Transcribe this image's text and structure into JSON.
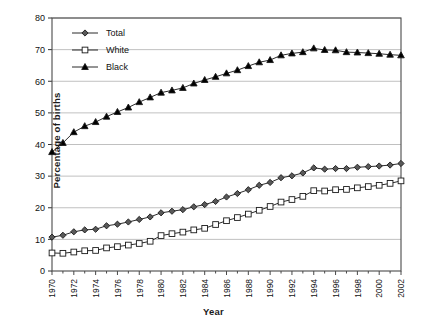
{
  "chart_data": {
    "type": "line",
    "title": "",
    "xlabel": "Year",
    "ylabel": "Percentage of births",
    "xlim": [
      1970,
      2002
    ],
    "ylim": [
      0,
      80
    ],
    "ytick_step": 10,
    "yticks": [
      "0",
      "10",
      "20",
      "30",
      "40",
      "50",
      "60",
      "70",
      "80"
    ],
    "xticks": [
      "1970",
      "1972",
      "1974",
      "1976",
      "1978",
      "1980",
      "1982",
      "1984",
      "1986",
      "1988",
      "1990",
      "1992",
      "1994",
      "1996",
      "1998",
      "2000",
      "2002"
    ],
    "grid": "horizontal",
    "legend_position": "upper-left-inside",
    "x": [
      1970,
      1971,
      1972,
      1973,
      1974,
      1975,
      1976,
      1977,
      1978,
      1979,
      1980,
      1981,
      1982,
      1983,
      1984,
      1985,
      1986,
      1987,
      1988,
      1989,
      1990,
      1991,
      1992,
      1993,
      1994,
      1995,
      1996,
      1997,
      1998,
      1999,
      2000,
      2001,
      2002
    ],
    "series": [
      {
        "name": "Total",
        "marker": "diamond",
        "color": "#595959",
        "values": [
          10.7,
          11.3,
          12.4,
          13.0,
          13.2,
          14.3,
          14.8,
          15.5,
          16.3,
          17.1,
          18.4,
          18.9,
          19.4,
          20.3,
          21.0,
          22.0,
          23.4,
          24.5,
          25.7,
          27.1,
          28.0,
          29.5,
          30.1,
          31.0,
          32.6,
          32.2,
          32.4,
          32.4,
          32.8,
          33.0,
          33.2,
          33.5,
          34.0
        ]
      },
      {
        "name": "White",
        "marker": "square",
        "color": "#ffffff",
        "values": [
          5.7,
          5.6,
          6.0,
          6.4,
          6.5,
          7.3,
          7.7,
          8.2,
          8.7,
          9.4,
          11.2,
          11.8,
          12.3,
          13.0,
          13.5,
          14.7,
          15.9,
          16.9,
          18.0,
          19.2,
          20.4,
          21.8,
          22.6,
          23.6,
          25.4,
          25.3,
          25.7,
          25.8,
          26.3,
          26.7,
          27.1,
          27.7,
          28.5
        ]
      },
      {
        "name": "Black",
        "marker": "triangle",
        "color": "#000000",
        "values": [
          37.6,
          40.5,
          43.9,
          45.8,
          47.1,
          48.8,
          50.3,
          51.7,
          53.4,
          54.9,
          56.4,
          57.1,
          57.9,
          59.3,
          60.4,
          61.4,
          62.5,
          63.5,
          64.8,
          66.0,
          66.7,
          68.2,
          68.8,
          69.2,
          70.4,
          69.9,
          69.8,
          69.2,
          69.1,
          68.9,
          68.7,
          68.4,
          68.2
        ]
      }
    ]
  },
  "legend": {
    "items": [
      {
        "label": "Total"
      },
      {
        "label": "White"
      },
      {
        "label": "Black"
      }
    ]
  },
  "axes": {
    "x_title": "Year",
    "y_title": "Percentage of births"
  }
}
